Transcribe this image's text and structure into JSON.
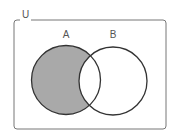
{
  "diagram": {
    "type": "venn",
    "universe_label": "U",
    "sets": [
      {
        "label": "A",
        "shaded": "A only (A minus B)"
      },
      {
        "label": "B"
      }
    ],
    "shaded_region": "A \\ B",
    "colors": {
      "shade": "#a9a9a9",
      "stroke": "#333333",
      "frame": "#777777",
      "background": "#ffffff"
    }
  }
}
